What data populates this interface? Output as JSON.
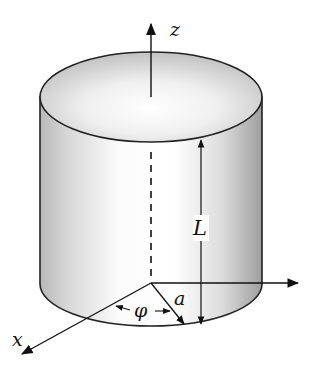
{
  "diagram": {
    "labels": {
      "z_axis": "z",
      "x_axis": "x",
      "length": "L",
      "radius": "a",
      "angle": "φ"
    },
    "elements": [
      {
        "type": "cylinder",
        "description": "shaded circular cylinder with elliptical top face"
      },
      {
        "type": "axis",
        "name": "z",
        "direction": "up"
      },
      {
        "type": "axis",
        "name": "x",
        "direction": "down-left"
      },
      {
        "type": "axis",
        "name": "y",
        "direction": "right",
        "label_visible": false
      },
      {
        "type": "dimension",
        "name": "L",
        "description": "cylinder height arrow"
      },
      {
        "type": "dimension",
        "name": "a",
        "description": "radius arrow from base center"
      },
      {
        "type": "angle",
        "name": "φ",
        "description": "azimuthal angle between x-axis and radius"
      },
      {
        "type": "dashed-line",
        "description": "hidden central axis inside cylinder"
      }
    ],
    "colors": {
      "stroke": "#222222",
      "shade_dark": "#b5b5b5",
      "shade_light": "#ffffff"
    }
  }
}
